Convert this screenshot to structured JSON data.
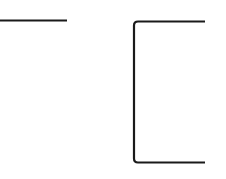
{
  "canvas": {
    "width": 226,
    "height": 179,
    "background": "#ffffff"
  },
  "shapes": {
    "stroke_color": "#1a1a1a",
    "stroke_width": 2.2,
    "horizontal_line": {
      "x1": 0,
      "y1": 20.5,
      "x2": 67,
      "y2": 20.5
    },
    "bracket": {
      "left_x": 134,
      "top_y": 21.5,
      "bottom_y": 162.5,
      "right_x": 205,
      "corner_radius": 4
    }
  }
}
